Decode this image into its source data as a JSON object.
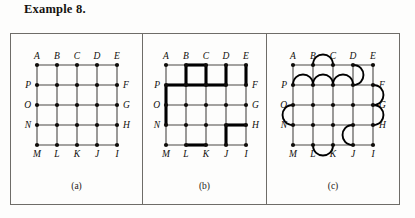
{
  "title": "Example 8.",
  "colors": {
    "ink": "#100e0b",
    "thin_edge": "#4a4845",
    "bold_edge": "#000000",
    "frame": "#6e6c68",
    "page": "#fdfdfc"
  },
  "figure": {
    "panels": [
      {
        "id": "a",
        "caption": "(a)",
        "description": "5 by 5 square lattice graph with all grid edges drawn uniformly thin",
        "vertex_labels": {
          "top": [
            "A",
            "B",
            "C",
            "D",
            "E"
          ],
          "left": [
            "P",
            "O",
            "N"
          ],
          "right": [
            "F",
            "G",
            "H"
          ],
          "bottom": [
            "M",
            "L",
            "K",
            "J",
            "I"
          ]
        },
        "grid": {
          "cols": 5,
          "rows": 5,
          "spacing": 20
        },
        "bold_edges": [],
        "arcs": []
      },
      {
        "id": "b",
        "caption": "(b)",
        "description": "Same lattice with a spanning subgraph of edges emphasized in heavy stroke",
        "vertex_labels": {
          "top": [
            "A",
            "B",
            "C",
            "D",
            "E"
          ],
          "left": [
            "P",
            "O",
            "N"
          ],
          "right": [
            "F",
            "G",
            "H"
          ],
          "bottom": [
            "M",
            "L",
            "K",
            "J",
            "I"
          ]
        },
        "grid": {
          "cols": 5,
          "rows": 5,
          "spacing": 20
        },
        "bold_edges": [
          [
            1,
            0,
            2,
            0
          ],
          [
            1,
            0,
            1,
            1
          ],
          [
            2,
            0,
            2,
            1
          ],
          [
            3,
            0,
            3,
            1
          ],
          [
            4,
            0,
            4,
            1
          ],
          [
            0,
            1,
            1,
            1
          ],
          [
            1,
            1,
            2,
            1
          ],
          [
            2,
            1,
            3,
            1
          ],
          [
            0,
            1,
            0,
            2
          ],
          [
            0,
            2,
            0,
            3
          ],
          [
            3,
            3,
            4,
            3
          ],
          [
            3,
            3,
            3,
            4
          ],
          [
            1,
            4,
            2,
            4
          ]
        ],
        "arcs": []
      },
      {
        "id": "c",
        "caption": "(c)",
        "description": "Same lattice with extra curved arcs added as doubled edges",
        "vertex_labels": {
          "top": [
            "A",
            "B",
            "C",
            "D",
            "E"
          ],
          "left": [
            "P",
            "O",
            "N"
          ],
          "right": [
            "F",
            "G",
            "H"
          ],
          "bottom": [
            "M",
            "L",
            "K",
            "J",
            "I"
          ]
        },
        "grid": {
          "cols": 5,
          "rows": 5,
          "spacing": 20
        },
        "bold_edges": [],
        "arcs": [
          {
            "from": [
              1,
              0
            ],
            "to": [
              2,
              0
            ],
            "bulge": "up",
            "size": 9
          },
          {
            "from": [
              0,
              1
            ],
            "to": [
              1,
              1
            ],
            "bulge": "up",
            "size": 9
          },
          {
            "from": [
              1,
              1
            ],
            "to": [
              2,
              1
            ],
            "bulge": "up",
            "size": 9
          },
          {
            "from": [
              2,
              1
            ],
            "to": [
              3,
              1
            ],
            "bulge": "up",
            "size": 9
          },
          {
            "from": [
              3,
              0
            ],
            "to": [
              3,
              1
            ],
            "bulge": "right",
            "size": 9
          },
          {
            "from": [
              4,
              1
            ],
            "to": [
              4,
              2
            ],
            "bulge": "right",
            "size": 9
          },
          {
            "from": [
              4,
              2
            ],
            "to": [
              4,
              3
            ],
            "bulge": "right",
            "size": 9
          },
          {
            "from": [
              0,
              2
            ],
            "to": [
              0,
              3
            ],
            "bulge": "left",
            "size": 9
          },
          {
            "from": [
              3,
              3
            ],
            "to": [
              3,
              4
            ],
            "bulge": "left",
            "size": 9
          },
          {
            "from": [
              1,
              4
            ],
            "to": [
              2,
              4
            ],
            "bulge": "down",
            "size": 9
          }
        ]
      }
    ]
  }
}
